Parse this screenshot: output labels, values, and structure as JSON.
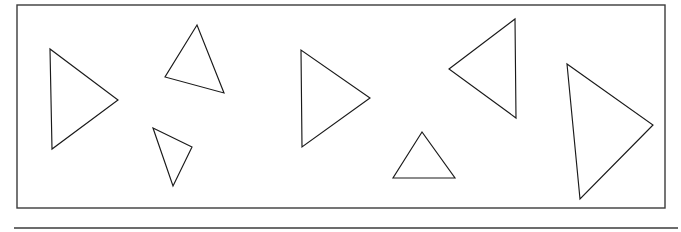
{
  "figure": {
    "canvas": {
      "width": 681,
      "height": 232
    },
    "background_color": "#ffffff",
    "stroke_color": "#1a1a1a",
    "frame_color": "#3b3b3b"
  },
  "frame": {
    "name": "panel-border",
    "x": 17,
    "y": 5,
    "width": 648,
    "height": 203,
    "stroke_width": 1.4
  },
  "separator": {
    "name": "horizontal-rule",
    "x1": 14,
    "y1": 228,
    "x2": 678,
    "y2": 228,
    "stroke_width": 1.6
  },
  "shapes": [
    {
      "id": "triangle-1",
      "label": "Triangle 1",
      "orientation": "pointing-right",
      "points": "50,49 52,149 118,100",
      "vertices": [
        [
          50,
          49
        ],
        [
          52,
          149
        ],
        [
          118,
          100
        ]
      ]
    },
    {
      "id": "triangle-2",
      "label": "Triangle 2",
      "orientation": "pointing-up",
      "points": "197,25 165,77 224,93",
      "vertices": [
        [
          197,
          25
        ],
        [
          165,
          77
        ],
        [
          224,
          93
        ]
      ]
    },
    {
      "id": "triangle-3",
      "label": "Triangle 3",
      "orientation": "pointing-down",
      "points": "153,128 192,147 173,186",
      "vertices": [
        [
          153,
          128
        ],
        [
          192,
          147
        ],
        [
          173,
          186
        ]
      ]
    },
    {
      "id": "triangle-4",
      "label": "Triangle 4",
      "orientation": "pointing-right",
      "points": "301,50 302,147 370,98",
      "vertices": [
        [
          301,
          50
        ],
        [
          302,
          147
        ],
        [
          370,
          98
        ]
      ]
    },
    {
      "id": "triangle-5",
      "label": "Triangle 5",
      "orientation": "pointing-up",
      "points": "422,132 393,178 455,178",
      "vertices": [
        [
          422,
          132
        ],
        [
          393,
          178
        ],
        [
          455,
          178
        ]
      ]
    },
    {
      "id": "triangle-6",
      "label": "Triangle 6",
      "orientation": "pointing-left",
      "points": "449,69 515,19 516,118",
      "vertices": [
        [
          449,
          69
        ],
        [
          515,
          19
        ],
        [
          516,
          118
        ]
      ]
    },
    {
      "id": "triangle-7",
      "label": "Triangle 7",
      "orientation": "pointing-right",
      "points": "567,64 580,199 653,125",
      "vertices": [
        [
          567,
          64
        ],
        [
          580,
          199
        ],
        [
          653,
          125
        ]
      ]
    }
  ]
}
